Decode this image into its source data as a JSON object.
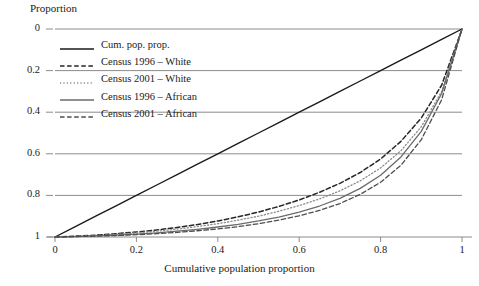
{
  "chart_data": {
    "type": "line",
    "title": "",
    "xlabel": "Cumulative population proportion",
    "ylabel": "Proportion",
    "xlim": [
      0,
      1
    ],
    "ylim": [
      0,
      1
    ],
    "grid": "horizontal",
    "legend_position": "upper-left",
    "x_ticks": [
      "0",
      "0.2",
      "0.4",
      "0.6",
      "0.8",
      "1"
    ],
    "x_tick_values": [
      0,
      0.2,
      0.4,
      0.6,
      0.8,
      1
    ],
    "y_ticks": [
      "0",
      "0.2",
      "0.4",
      "0.6",
      "0.8",
      "1"
    ],
    "y_tick_values": [
      0,
      0.2,
      0.4,
      0.6,
      0.8,
      1
    ],
    "x": [
      0,
      0.05,
      0.1,
      0.15,
      0.2,
      0.25,
      0.3,
      0.35,
      0.4,
      0.45,
      0.5,
      0.55,
      0.6,
      0.65,
      0.7,
      0.75,
      0.8,
      0.85,
      0.9,
      0.95,
      1
    ],
    "series": [
      {
        "name": "Cum. pop. prop.",
        "style": "solid",
        "color": "#1a1a1a",
        "width": 1.4,
        "values": [
          0,
          0.05,
          0.1,
          0.15,
          0.2,
          0.25,
          0.3,
          0.35,
          0.4,
          0.45,
          0.5,
          0.55,
          0.6,
          0.65,
          0.7,
          0.75,
          0.8,
          0.85,
          0.9,
          0.95,
          1
        ]
      },
      {
        "name": "Census 1996 – White",
        "style": "dashed",
        "color": "#262626",
        "width": 1.5,
        "values": [
          0,
          0.004,
          0.009,
          0.016,
          0.024,
          0.034,
          0.046,
          0.06,
          0.077,
          0.097,
          0.12,
          0.147,
          0.178,
          0.215,
          0.258,
          0.31,
          0.375,
          0.46,
          0.572,
          0.73,
          1
        ]
      },
      {
        "name": "Census 2001 – White",
        "style": "dotted",
        "color": "#8c8c8c",
        "width": 1.3,
        "values": [
          0,
          0.003,
          0.007,
          0.013,
          0.02,
          0.028,
          0.038,
          0.05,
          0.064,
          0.081,
          0.1,
          0.124,
          0.151,
          0.183,
          0.222,
          0.27,
          0.332,
          0.415,
          0.53,
          0.7,
          1
        ]
      },
      {
        "name": "Census 1996 – African",
        "style": "solid",
        "color": "#6b6b6b",
        "width": 1.3,
        "values": [
          0,
          0.002,
          0.005,
          0.009,
          0.014,
          0.02,
          0.028,
          0.037,
          0.048,
          0.061,
          0.077,
          0.096,
          0.12,
          0.149,
          0.186,
          0.234,
          0.297,
          0.385,
          0.508,
          0.69,
          1
        ]
      },
      {
        "name": "Census 2001 – African",
        "style": "dashed",
        "color": "#4d4d4d",
        "width": 1.3,
        "values": [
          0,
          0.002,
          0.004,
          0.007,
          0.011,
          0.016,
          0.022,
          0.03,
          0.039,
          0.05,
          0.064,
          0.081,
          0.102,
          0.128,
          0.161,
          0.205,
          0.263,
          0.345,
          0.468,
          0.66,
          1
        ]
      }
    ]
  },
  "axes": {
    "y_title": "Proportion",
    "x_title": "Cumulative population proportion"
  },
  "legend": {
    "items": [
      {
        "label": "Cum. pop. prop."
      },
      {
        "label": "Census 1996 – White"
      },
      {
        "label": "Census 2001 – White"
      },
      {
        "label": "Census 1996 – African"
      },
      {
        "label": "Census 2001 – African"
      }
    ]
  },
  "ticks": {
    "y": [
      {
        "label": "1"
      },
      {
        "label": "0.8"
      },
      {
        "label": "0.6"
      },
      {
        "label": "0.4"
      },
      {
        "label": "0.2"
      },
      {
        "label": "0"
      }
    ],
    "x": [
      {
        "label": "0"
      },
      {
        "label": "0.2"
      },
      {
        "label": "0.4"
      },
      {
        "label": "0.6"
      },
      {
        "label": "0.8"
      },
      {
        "label": "1"
      }
    ]
  },
  "colors": {
    "grid": "#8c8c8c",
    "axis": "#8c8c8c",
    "text": "#1a1a1a"
  }
}
